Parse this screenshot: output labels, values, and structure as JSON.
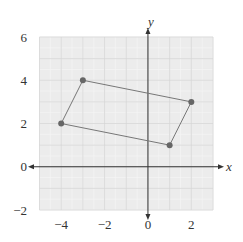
{
  "chart_data": {
    "type": "scatter",
    "title": "",
    "xlabel": "x",
    "ylabel": "y",
    "xlim": [
      -5,
      3
    ],
    "ylim": [
      -2,
      6
    ],
    "xticks": [
      -4,
      -2,
      0,
      2
    ],
    "yticks": [
      -2,
      0,
      2,
      4,
      6
    ],
    "xtick_labels": [
      "−4",
      "−2",
      "0",
      "2"
    ],
    "ytick_labels": [
      "−2",
      "0",
      "2",
      "4",
      "6"
    ],
    "grid": true,
    "minor_grid_step": 0.5,
    "major_grid_step": 1,
    "legend": null,
    "shapes": [
      {
        "type": "polygon",
        "name": "parallelogram",
        "closed": true,
        "vertices": [
          {
            "x": -4,
            "y": 2
          },
          {
            "x": -3,
            "y": 4
          },
          {
            "x": 2,
            "y": 3
          },
          {
            "x": 1,
            "y": 1
          }
        ]
      }
    ],
    "series": [
      {
        "name": "vertices",
        "points": [
          {
            "x": -4,
            "y": 2
          },
          {
            "x": -3,
            "y": 4
          },
          {
            "x": 2,
            "y": 3
          },
          {
            "x": 1,
            "y": 1
          }
        ]
      }
    ]
  },
  "colors": {
    "grid_background": "#ececec",
    "minor_grid": "#f5f5f5",
    "major_grid": "#d6d6d6",
    "axis": "#333333",
    "polygon_stroke": "#777777",
    "vertex": "#666666"
  }
}
